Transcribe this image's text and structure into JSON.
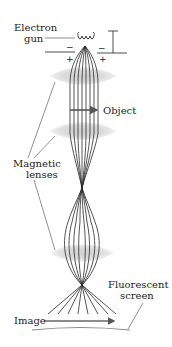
{
  "diagram": {
    "type": "electron-microscope-schematic",
    "labels": {
      "electron_gun_line1": "Electron",
      "electron_gun_line2": "gun",
      "object": "Object",
      "magnetic_lenses_line1": "Magnetic",
      "magnetic_lenses_line2": "lenses",
      "fluorescent_screen_line1": "Fluorescent",
      "fluorescent_screen_line2": "screen",
      "image": "Image"
    },
    "symbols": {
      "minus": "−",
      "plus": "+"
    },
    "components": [
      {
        "name": "electron-gun",
        "label_ref": "electron_gun"
      },
      {
        "name": "condenser-lens",
        "label_ref": "magnetic_lenses"
      },
      {
        "name": "object",
        "label_ref": "object"
      },
      {
        "name": "objective-lens",
        "label_ref": "magnetic_lenses"
      },
      {
        "name": "projector-lens",
        "label_ref": "magnetic_lenses"
      },
      {
        "name": "fluorescent-screen",
        "label_ref": "fluorescent_screen"
      },
      {
        "name": "image",
        "label_ref": "image"
      }
    ],
    "colors": {
      "ray": "#2a2a2a",
      "lens_fill": "#d9d9d9",
      "lens_edge": "#f2f2f2",
      "text": "#222222",
      "arrow": "#555555",
      "screen": "#888888"
    }
  }
}
